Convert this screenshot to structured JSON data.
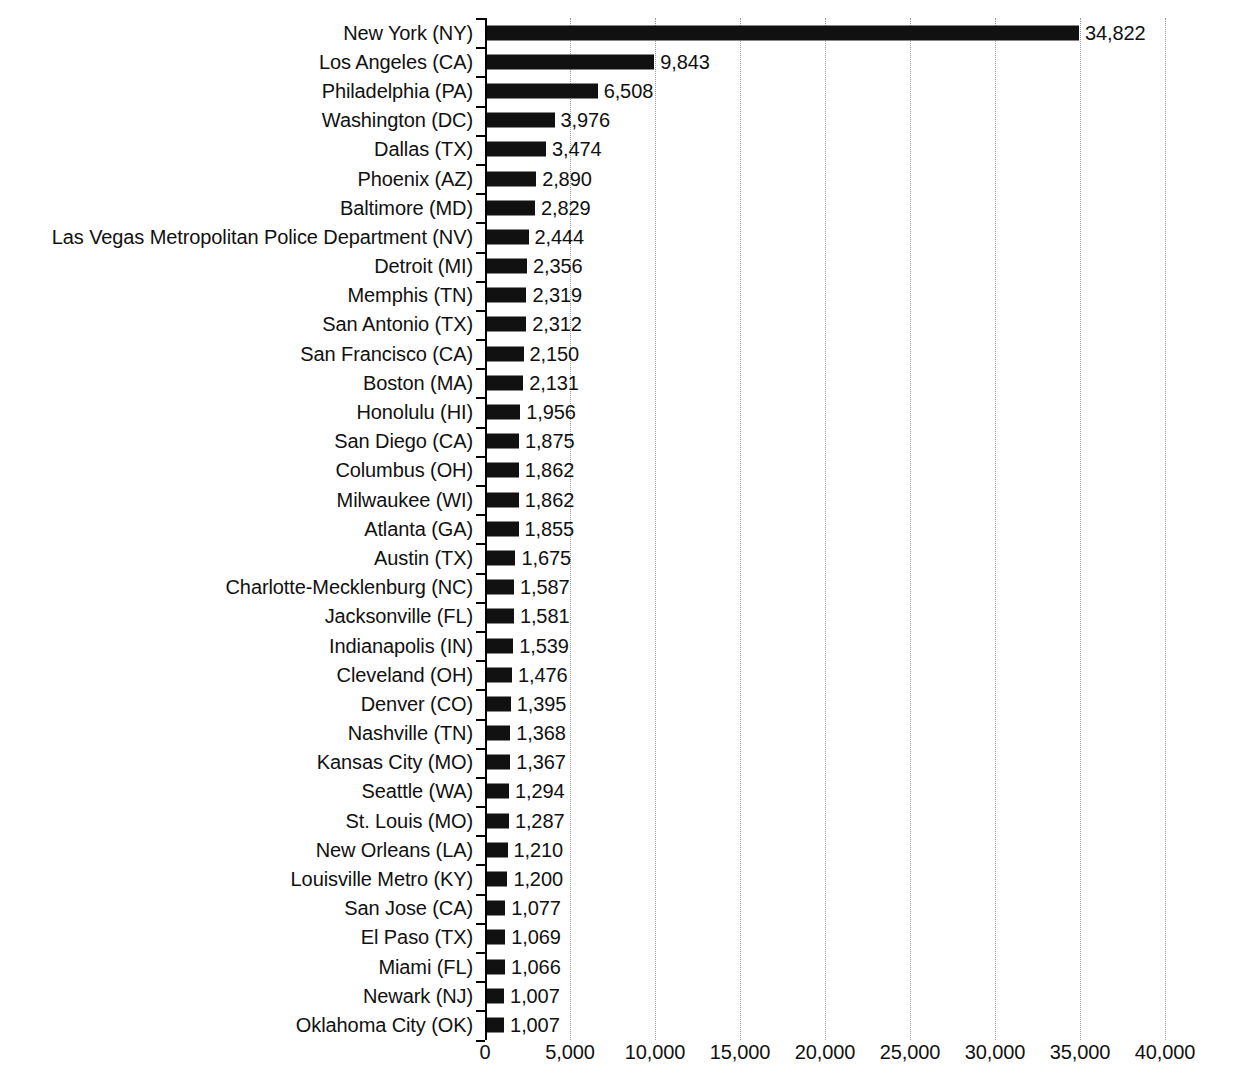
{
  "chart_data": {
    "type": "bar",
    "orientation": "horizontal",
    "title": "",
    "xlabel": "",
    "ylabel": "",
    "xlim": [
      0,
      40000
    ],
    "grid": true,
    "gridline_style": "dotted",
    "legend": false,
    "bar_color": "#111111",
    "categories": [
      "New York (NY)",
      "Los Angeles (CA)",
      "Philadelphia (PA)",
      "Washington (DC)",
      "Dallas (TX)",
      "Phoenix (AZ)",
      "Baltimore (MD)",
      "Las Vegas Metropolitan Police Department (NV)",
      "Detroit (MI)",
      "Memphis (TN)",
      "San Antonio (TX)",
      "San Francisco (CA)",
      "Boston (MA)",
      "Honolulu (HI)",
      "San Diego (CA)",
      "Columbus (OH)",
      "Milwaukee (WI)",
      "Atlanta (GA)",
      "Austin (TX)",
      "Charlotte-Mecklenburg (NC)",
      "Jacksonville (FL)",
      "Indianapolis (IN)",
      "Cleveland (OH)",
      "Denver (CO)",
      "Nashville (TN)",
      "Kansas City (MO)",
      "Seattle (WA)",
      "St. Louis (MO)",
      "New Orleans (LA)",
      "Louisville Metro (KY)",
      "San Jose (CA)",
      "El Paso (TX)",
      "Miami (FL)",
      "Newark (NJ)",
      "Oklahoma City (OK)"
    ],
    "values": [
      34822,
      9843,
      6508,
      3976,
      3474,
      2890,
      2829,
      2444,
      2356,
      2319,
      2312,
      2150,
      2131,
      1956,
      1875,
      1862,
      1862,
      1855,
      1675,
      1587,
      1581,
      1539,
      1476,
      1395,
      1368,
      1367,
      1294,
      1287,
      1210,
      1200,
      1077,
      1069,
      1066,
      1007,
      1007
    ],
    "value_labels": [
      "34,822",
      "9,843",
      "6,508",
      "3,976",
      "3,474",
      "2,890",
      "2,829",
      "2,444",
      "2,356",
      "2,319",
      "2,312",
      "2,150",
      "2,131",
      "1,956",
      "1,875",
      "1,862",
      "1,862",
      "1,855",
      "1,675",
      "1,587",
      "1,581",
      "1,539",
      "1,476",
      "1,395",
      "1,368",
      "1,367",
      "1,294",
      "1,287",
      "1,210",
      "1,200",
      "1,077",
      "1,069",
      "1,066",
      "1,007",
      "1,007"
    ],
    "x_ticks": [
      0,
      5000,
      10000,
      15000,
      20000,
      25000,
      30000,
      35000,
      40000
    ],
    "x_tick_labels": [
      "0",
      "5,000",
      "10,000",
      "15,000",
      "20,000",
      "25,000",
      "30,000",
      "35,000",
      "40,000"
    ]
  }
}
